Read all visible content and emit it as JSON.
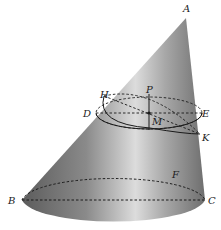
{
  "diagram": {
    "type": "oblique-cone",
    "colors": {
      "surface_dark": "#5a5a5a",
      "surface_light": "#d8d8d8",
      "line": "#1a1a1a",
      "background": "#ffffff"
    },
    "points": {
      "A": {
        "label": "A",
        "x": 186,
        "y": 11
      },
      "B": {
        "label": "B",
        "x": 8,
        "y": 203
      },
      "C": {
        "label": "C",
        "x": 208,
        "y": 203
      },
      "F": {
        "label": "F",
        "x": 174,
        "y": 177
      },
      "H": {
        "label": "H",
        "x": 99,
        "y": 98
      },
      "P": {
        "label": "P",
        "x": 147,
        "y": 92
      },
      "D": {
        "label": "D",
        "x": 83,
        "y": 117
      },
      "E": {
        "label": "E",
        "x": 200,
        "y": 117
      },
      "M": {
        "label": "M",
        "x": 152,
        "y": 125
      },
      "K": {
        "label": "K",
        "x": 202,
        "y": 140
      }
    }
  }
}
